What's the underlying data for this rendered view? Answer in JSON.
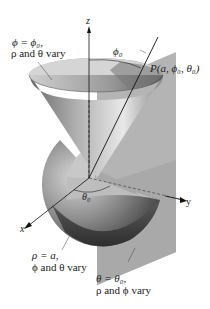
{
  "figure": {
    "type": "spherical-coordinate-surfaces",
    "axes": {
      "z_label": "z",
      "y_label": "y",
      "x_label": "x"
    },
    "cone_label": {
      "line1": "ϕ = ϕ₀,",
      "line2": "ρ and θ vary"
    },
    "sphere_label": {
      "line1": "ρ = a,",
      "line2": "ϕ and θ vary"
    },
    "plane_label": {
      "line1": "θ = θ₀,",
      "line2": "ρ and ϕ vary"
    },
    "point_label": "P(a, ϕ₀, θ₀)",
    "phi_angle_label": "ϕ₀",
    "theta_angle_label": "θ₀"
  }
}
